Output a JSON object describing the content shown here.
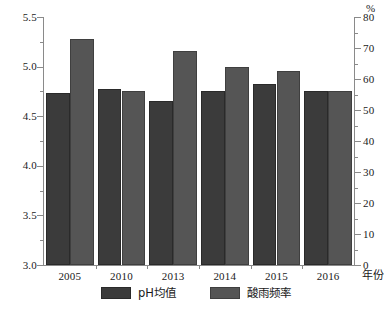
{
  "chart_data": {
    "type": "bar",
    "title": "",
    "subtitle": "",
    "categories": [
      "2005",
      "2010",
      "2013",
      "2014",
      "2015",
      "2016"
    ],
    "series": [
      {
        "name": "pH均值",
        "axis": "left",
        "color": "#3b3b3b",
        "values": [
          4.73,
          4.77,
          4.65,
          4.75,
          4.82,
          4.75
        ]
      },
      {
        "name": "酸雨频率",
        "axis": "right",
        "color": "#555555",
        "values": [
          73,
          56,
          69,
          64,
          62.5,
          56
        ]
      }
    ],
    "xlabel": "年份",
    "ylabel_left": "",
    "ylabel_right": "%",
    "ylim_left": [
      3.0,
      5.5
    ],
    "ylim_right": [
      0,
      80
    ],
    "yticks_left": [
      "5.5",
      "5.0",
      "4.5",
      "4.0",
      "3.5",
      "3.0"
    ],
    "yticks_left_values": [
      5.5,
      5.0,
      4.5,
      4.0,
      3.5,
      3.0
    ],
    "yminor_left_values": [
      5.25,
      4.75,
      4.25,
      3.75,
      3.25
    ],
    "yticks_right": [
      "80",
      "70",
      "60",
      "50",
      "40",
      "30",
      "20",
      "10",
      "0"
    ],
    "yticks_right_values": [
      80,
      70,
      60,
      50,
      40,
      30,
      20,
      10,
      0
    ],
    "yminor_right_values": [
      75,
      65,
      55,
      45,
      35,
      25,
      15,
      5
    ],
    "grid": false,
    "legend_position": "bottom-center",
    "legend": [
      "pH均值",
      "酸雨频率"
    ]
  },
  "axes": {
    "unit_right": "%",
    "xaxis_title": "年份"
  }
}
